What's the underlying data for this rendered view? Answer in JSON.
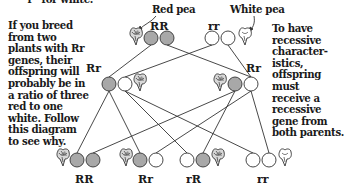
{
  "header_fragment": "“r” for white.",
  "left_text": "If you breed\nfrom two\nplants with Rr\ngenes, their\noffspring will\nprobably be in\na ratio of three\nred to one\nwhite. Follow\nthis diagram\nto see why.",
  "right_text": "To have\nrecessive\ncharacter-\nistics,\noffspring\nmust\nreceive a\nrecessive\ngene from\nboth parents.",
  "labels": {
    "red_pea": "Red pea",
    "white_pea": "White pea"
  },
  "grandparents": [
    {
      "genotype": "RR",
      "alleles": [
        "R",
        "R"
      ],
      "flower": "red"
    },
    {
      "genotype": "rr",
      "alleles": [
        "r",
        "r"
      ],
      "flower": "white"
    }
  ],
  "parents": [
    {
      "genotype": "Rr",
      "alleles": [
        "R",
        "r"
      ],
      "flower": "red"
    },
    {
      "genotype": "Rr",
      "alleles": [
        "R",
        "r"
      ],
      "flower": "red"
    }
  ],
  "offspring": [
    {
      "genotype": "RR",
      "alleles": [
        "R",
        "R"
      ],
      "flower": "red"
    },
    {
      "genotype": "Rr",
      "alleles": [
        "R",
        "r"
      ],
      "flower": "red"
    },
    {
      "genotype": "rR",
      "alleles": [
        "r",
        "R"
      ],
      "flower": "red"
    },
    {
      "genotype": "rr",
      "alleles": [
        "r",
        "r"
      ],
      "flower": "white"
    }
  ],
  "colors": {
    "dominant_gene": "#a8a8a8",
    "recessive_gene": "#ffffff",
    "outline": "#333333",
    "text": "#1a1a1a"
  }
}
